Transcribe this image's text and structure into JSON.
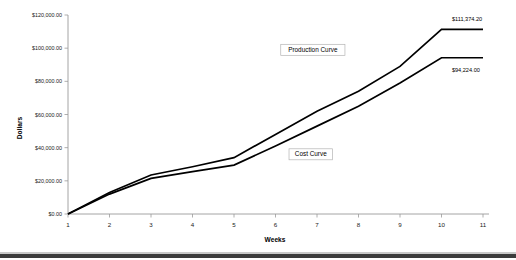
{
  "chart_data": {
    "type": "line",
    "title": "",
    "xlabel": "Weeks",
    "ylabel": "Dollars",
    "x": [
      1,
      2,
      3,
      4,
      5,
      6,
      7,
      8,
      9,
      10,
      11
    ],
    "xtick_labels": [
      "1",
      "2",
      "3",
      "4",
      "5",
      "6",
      "7",
      "8",
      "9",
      "10",
      "11"
    ],
    "xlim": [
      1,
      11
    ],
    "ylim": [
      0,
      120000
    ],
    "ytick_values": [
      0,
      20000,
      40000,
      60000,
      80000,
      100000,
      120000
    ],
    "ytick_labels": [
      "$0.00",
      "$20,000.00",
      "$40,000.00",
      "$60,000.00",
      "$80,000.00",
      "$100,000.00",
      "$120,000.00"
    ],
    "grid": false,
    "legend_position": "inline-annotations",
    "series": [
      {
        "name": "Production Curve",
        "label": "Production Curve",
        "color": "#000000",
        "values": [
          0,
          13000,
          23500,
          28500,
          34000,
          48000,
          62000,
          74000,
          89000,
          111374.2,
          111374.2
        ],
        "end_value_label": "$111,374.20"
      },
      {
        "name": "Cost Curve",
        "label": "Cost Curve",
        "color": "#000000",
        "values": [
          0,
          12000,
          21500,
          25500,
          29500,
          41000,
          53000,
          65000,
          79000,
          94224.0,
          94224.0
        ],
        "end_value_label": "$94,224.00"
      }
    ],
    "annotations": [
      {
        "text": "Production Curve",
        "x": 6.9,
        "y": 99000
      },
      {
        "text": "Cost Curve",
        "x": 6.85,
        "y": 36000
      },
      {
        "text": "$111,374.20",
        "x": 10.25,
        "y": 117500
      },
      {
        "text": "$94,224.00",
        "x": 10.25,
        "y": 87000
      }
    ]
  }
}
